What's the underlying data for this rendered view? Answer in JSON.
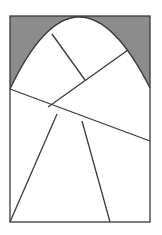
{
  "figure": {
    "colors": {
      "stroke": "#3a3a3a",
      "shade": "#8c8c8c",
      "fill": "#ffffff"
    },
    "rectangle": {
      "x1": 10,
      "y1": 16,
      "x2": 150,
      "y2": 222
    },
    "arch": {
      "left": [
        10,
        89
      ],
      "apex": [
        79,
        17
      ],
      "right": [
        150,
        88
      ]
    },
    "segments": [
      {
        "name": "arch-inner-divider",
        "from": [
          52,
          34
        ],
        "to": [
          85,
          80
        ]
      },
      {
        "name": "arch-diagonal",
        "from": [
          48,
          107
        ],
        "to": [
          128,
          50
        ]
      },
      {
        "name": "cross-line",
        "from": [
          10,
          89
        ],
        "to": [
          150,
          141
        ]
      },
      {
        "name": "trapezoid-left-leg",
        "from": [
          57,
          114
        ],
        "to": [
          10,
          222
        ]
      },
      {
        "name": "trapezoid-right-leg",
        "from": [
          82,
          121
        ],
        "to": [
          110,
          222
        ]
      }
    ]
  }
}
